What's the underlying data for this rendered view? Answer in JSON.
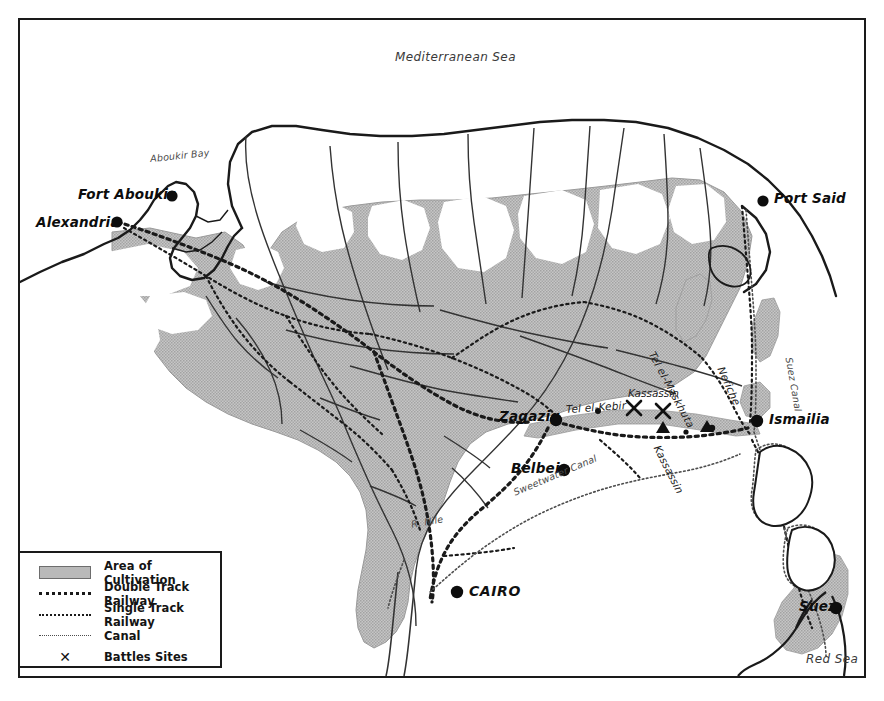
{
  "map": {
    "title": "Egypt 1882 Campaign Map",
    "frame": {
      "border_color": "#1a1a1a"
    },
    "colors": {
      "cultivation": "#b9b9b9",
      "cultivation_edge": "#8f8f8f",
      "coastline": "#1a1a1a",
      "railway": "#1a1a1a",
      "canal": "#4d4d4d",
      "water_label": "#3a3a3a",
      "background": "#ffffff"
    },
    "seas": [
      {
        "name": "mediterranean-sea",
        "label": "Mediterranean Sea"
      },
      {
        "name": "aboukir-bay",
        "label": "Aboukir Bay"
      },
      {
        "name": "red-sea",
        "label": "Red Sea"
      }
    ],
    "cities": [
      {
        "name": "alexandria",
        "label": "Alexandria"
      },
      {
        "name": "fort-aboukir",
        "label": "Fort Aboukir"
      },
      {
        "name": "port-said",
        "label": "Port Said"
      },
      {
        "name": "ismailia",
        "label": "Ismailia"
      },
      {
        "name": "zagazig",
        "label": "Zagazig"
      },
      {
        "name": "belbeis",
        "label": "Belbeis"
      },
      {
        "name": "cairo",
        "label": "CAIRO"
      },
      {
        "name": "suez",
        "label": "Suez"
      }
    ],
    "places": [
      {
        "name": "tel-el-kebir",
        "label": "Tel el-Kebir"
      },
      {
        "name": "tel-el-maskhuta",
        "label": "Tel el-Maskhuta"
      },
      {
        "name": "nefiche",
        "label": "Nefiche"
      },
      {
        "name": "kassassin-south",
        "label": "Kassassin"
      }
    ],
    "battles": [
      {
        "name": "battle-kassassin",
        "label": "Kassassin",
        "marker": "X",
        "count": 2
      }
    ],
    "waterways": [
      {
        "name": "suez-canal",
        "label": "Suez Canal"
      },
      {
        "name": "sweetwater-canal",
        "label": "Sweetwater Canal"
      },
      {
        "name": "river-nile",
        "label": "R. Nile"
      }
    ]
  },
  "legend": {
    "items": [
      {
        "key": "area-of-cultivation",
        "swatch": "fill",
        "label": "Area of Cultivation"
      },
      {
        "key": "double-track-railway",
        "swatch": "double",
        "label": "Double Track Railway"
      },
      {
        "key": "single-track-railway",
        "swatch": "single",
        "label": "Single Track Railway"
      },
      {
        "key": "canal",
        "swatch": "canal",
        "label": "Canal"
      },
      {
        "key": "battles-sites",
        "swatch": "x",
        "label": "Battles Sites"
      }
    ],
    "x_glyph": "✕"
  }
}
